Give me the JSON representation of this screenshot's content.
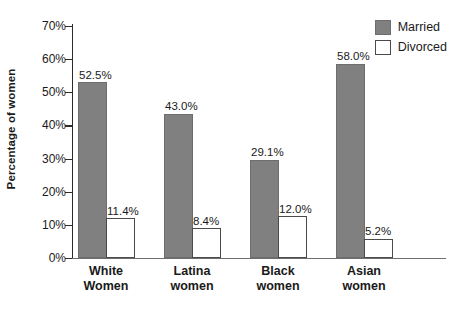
{
  "chart_data": {
    "type": "bar",
    "title": "",
    "xlabel": "",
    "ylabel": "Percentage of women",
    "ylim": [
      0,
      70
    ],
    "ytick_step": 10,
    "ytick_labels": [
      "0%",
      "10%",
      "20%",
      "30%",
      "40%",
      "50%",
      "60%",
      "70%"
    ],
    "ytick_values": [
      0,
      10,
      20,
      30,
      40,
      50,
      60,
      70
    ],
    "grid": false,
    "legend_position": "top-right",
    "categories": [
      "White\nWomen",
      "Latina\nwomen",
      "Black\nwomen",
      "Asian\nwomen"
    ],
    "series": [
      {
        "name": "Married",
        "color": "#808080",
        "values": [
          52.5,
          43.0,
          29.1,
          58.0
        ],
        "labels": [
          "52.5%",
          "43.0%",
          "29.1%",
          "58.0%"
        ]
      },
      {
        "name": "Divorced",
        "color": "#ffffff",
        "values": [
          11.4,
          8.4,
          12.0,
          5.2
        ],
        "labels": [
          "11.4%",
          "8.4%",
          "12.0%",
          "5.2%"
        ]
      }
    ]
  },
  "legend": {
    "items": [
      {
        "label": "Married"
      },
      {
        "label": "Divorced"
      }
    ]
  }
}
